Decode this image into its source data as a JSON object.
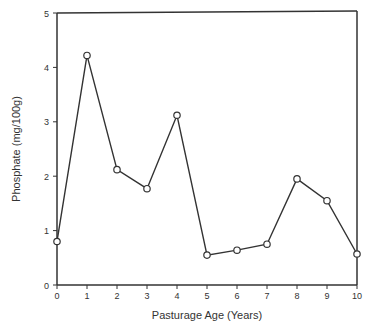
{
  "chart_data": {
    "type": "line",
    "title": "",
    "xlabel": "Pasturage Age (Years)",
    "ylabel": "Phosphate  (mg/100g)",
    "x": [
      0,
      1,
      2,
      3,
      4,
      5,
      6,
      7,
      8,
      9,
      10
    ],
    "values": [
      0.8,
      4.22,
      2.12,
      1.77,
      3.12,
      0.55,
      0.64,
      0.75,
      1.95,
      1.55,
      0.57
    ],
    "xlim": [
      0,
      10
    ],
    "ylim": [
      0,
      5
    ],
    "xticks": [
      "0",
      "1",
      "2",
      "3",
      "4",
      "5",
      "6",
      "7",
      "8",
      "9",
      "10"
    ],
    "yticks": [
      "0",
      "1",
      "2",
      "3",
      "4",
      "5"
    ],
    "grid": false,
    "marker": "open-circle",
    "line_color": "#333333"
  }
}
